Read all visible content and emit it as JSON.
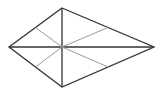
{
  "diagram": {
    "type": "kite",
    "vertices": {
      "top": [
        62,
        8
      ],
      "left": [
        9,
        47
      ],
      "right": [
        154,
        47
      ],
      "bottom": [
        62,
        87
      ]
    },
    "center": [
      62,
      47
    ],
    "side_midpoints": [
      [
        35.5,
        27.5
      ],
      [
        108,
        27.5
      ],
      [
        108,
        67
      ],
      [
        35.5,
        67
      ]
    ],
    "colors": {
      "outline": "#333333",
      "diagonal": "#333333",
      "midline": "#999999"
    }
  }
}
